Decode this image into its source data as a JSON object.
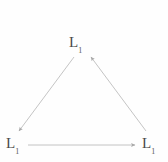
{
  "figure": {
    "background_color": "#fefefe",
    "edge_color": "#b9b9b9",
    "label_color": "#4a4a4a",
    "width": 168,
    "height": 162
  },
  "nodes": [
    {
      "id": "top",
      "base": "L",
      "subscript": "1",
      "x": 84,
      "y": 42
    },
    {
      "id": "bottom-left",
      "base": "L",
      "subscript": "1",
      "x": 15,
      "y": 143
    },
    {
      "id": "bottom-right",
      "base": "L",
      "subscript": "1",
      "x": 151,
      "y": 143
    }
  ],
  "edges": [
    {
      "id": "top-to-bottom-left",
      "from": "top",
      "to": "bottom-left",
      "x1": 74,
      "y1": 57,
      "x2": 19,
      "y2": 131,
      "arrow": "end"
    },
    {
      "id": "bottom-left-to-bottom-right",
      "from": "bottom-left",
      "to": "bottom-right",
      "x1": 28,
      "y1": 145,
      "x2": 135,
      "y2": 145,
      "arrow": "end"
    },
    {
      "id": "bottom-right-to-top",
      "from": "bottom-right",
      "to": "top",
      "x1": 146,
      "y1": 131,
      "x2": 91,
      "y2": 57,
      "arrow": "end"
    }
  ]
}
